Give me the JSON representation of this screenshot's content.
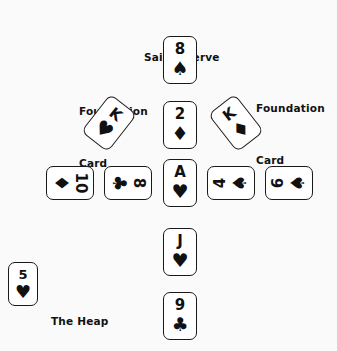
{
  "diagram": {
    "background_color": "#fafafa",
    "ink_color": "#111111",
    "labels": {
      "sail_reserve": "Sail Reserve",
      "foundation_line1": "Foundation",
      "foundation_line2": "Card",
      "the_heap": "The Heap"
    }
  },
  "suits": {
    "spade": "♠",
    "heart": "♥",
    "diamond": "♦",
    "club": "♣"
  },
  "cards": {
    "sail_reserve": {
      "rank": "8",
      "suit": "♠",
      "suit_name": "spades",
      "name": "8 of spades"
    },
    "center_second": {
      "rank": "2",
      "suit": "♦",
      "suit_name": "diamonds",
      "name": "2 of diamonds"
    },
    "center_ace": {
      "rank": "A",
      "suit": "♥",
      "suit_name": "hearts",
      "name": "ace of hearts"
    },
    "center_jack": {
      "rank": "J",
      "suit": "♥",
      "suit_name": "hearts",
      "name": "jack of hearts"
    },
    "center_nine": {
      "rank": "9",
      "suit": "♣",
      "suit_name": "clubs",
      "name": "9 of clubs"
    },
    "foundation_left": {
      "rank": "K",
      "suit": "♥",
      "suit_name": "hearts",
      "name": "king of hearts"
    },
    "foundation_right": {
      "rank": "K",
      "suit": "♦",
      "suit_name": "diamonds",
      "name": "king of diamonds"
    },
    "row_ten": {
      "rank": "10",
      "suit": "♦",
      "suit_name": "diamonds",
      "name": "10 of diamonds"
    },
    "row_eight": {
      "rank": "8",
      "suit": "♣",
      "suit_name": "clubs",
      "name": "8 of clubs"
    },
    "row_four": {
      "rank": "4",
      "suit": "♠",
      "suit_name": "spades",
      "name": "4 of spades"
    },
    "row_six": {
      "rank": "6",
      "suit": "♠",
      "suit_name": "spades",
      "name": "6 of spades"
    },
    "heap": {
      "rank": "5",
      "suit": "♥",
      "suit_name": "hearts",
      "name": "5 of hearts"
    }
  }
}
